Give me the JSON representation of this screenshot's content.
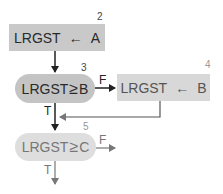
{
  "diagram": {
    "type": "flowchart",
    "nodes": [
      {
        "id": "2",
        "kind": "process",
        "label": "LRGST ← A",
        "var": "LRGST",
        "op": "←",
        "operand": "A"
      },
      {
        "id": "3",
        "kind": "decision",
        "label": "LRGST ≥ B",
        "var": "LRGST",
        "op": "≥",
        "operand": "B"
      },
      {
        "id": "4",
        "kind": "process",
        "label": "LRGST ← B",
        "var": "LRGST",
        "op": "←",
        "operand": "B"
      },
      {
        "id": "5",
        "kind": "decision",
        "label": "LRGST ≥ C",
        "var": "LRGST",
        "op": "≥",
        "operand": "C"
      }
    ],
    "edges": [
      {
        "from": "2",
        "to": "3",
        "label": ""
      },
      {
        "from": "3",
        "to": "4",
        "label": "F"
      },
      {
        "from": "3",
        "to": "5",
        "label": "T"
      },
      {
        "from": "4",
        "to": "5",
        "label": ""
      },
      {
        "from": "5",
        "to": "exit-right",
        "label": "F"
      },
      {
        "from": "5",
        "to": "exit-down",
        "label": "T"
      }
    ],
    "labels": {
      "true": "T",
      "false": "F"
    },
    "colors": {
      "box": "#c9c9c9",
      "box_light": "#d8d8d8",
      "pill_dark": "#c4c4c4",
      "pill_light": "#dedede",
      "line": "#222222",
      "line_light": "#777777"
    }
  }
}
